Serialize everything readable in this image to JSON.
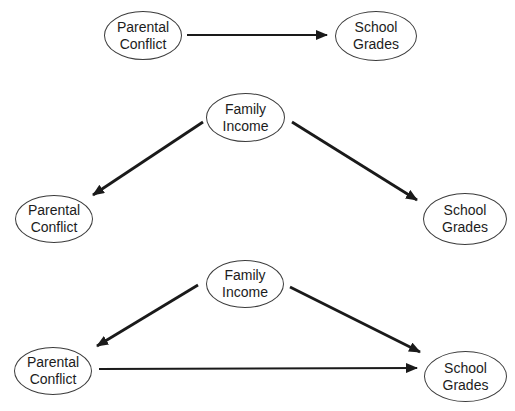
{
  "diagram_data": {
    "type": "causal-path-diagrams",
    "panels": [
      {
        "name": "direct-path-panel",
        "nodes": [
          {
            "id": "parental-conflict",
            "lines": [
              "Parental",
              "Conflict"
            ]
          },
          {
            "id": "school-grades",
            "lines": [
              "School",
              "Grades"
            ]
          }
        ],
        "edges": [
          {
            "from": "Parental Conflict",
            "to": "School Grades"
          }
        ]
      },
      {
        "name": "common-cause-panel",
        "nodes": [
          {
            "id": "family-income",
            "lines": [
              "Family",
              "Income"
            ]
          },
          {
            "id": "parental-conflict",
            "lines": [
              "Parental",
              "Conflict"
            ]
          },
          {
            "id": "school-grades",
            "lines": [
              "School",
              "Grades"
            ]
          }
        ],
        "edges": [
          {
            "from": "Family Income",
            "to": "Parental Conflict"
          },
          {
            "from": "Family Income",
            "to": "School Grades"
          }
        ]
      },
      {
        "name": "combined-model-panel",
        "nodes": [
          {
            "id": "family-income",
            "lines": [
              "Family",
              "Income"
            ]
          },
          {
            "id": "parental-conflict",
            "lines": [
              "Parental",
              "Conflict"
            ]
          },
          {
            "id": "school-grades",
            "lines": [
              "School",
              "Grades"
            ]
          }
        ],
        "edges": [
          {
            "from": "Family Income",
            "to": "Parental Conflict"
          },
          {
            "from": "Family Income",
            "to": "School Grades"
          },
          {
            "from": "Parental Conflict",
            "to": "School Grades"
          }
        ]
      }
    ],
    "colors": {
      "stroke": "#1a1a1a",
      "ellipse_outline": "#3c3c3c",
      "background": "#ffffff"
    }
  }
}
